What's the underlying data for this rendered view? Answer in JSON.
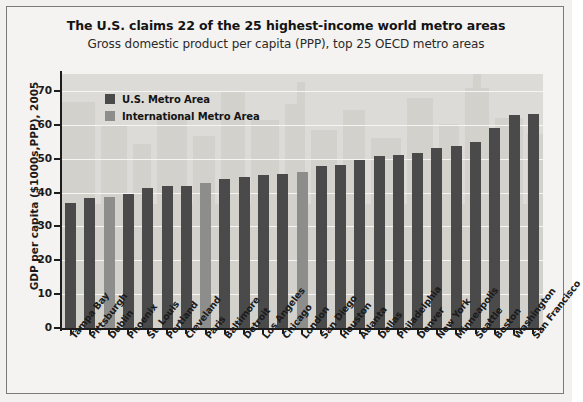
{
  "chart_data": {
    "type": "bar",
    "title": "The U.S. claims 22 of the 25 highest-income world metro areas",
    "subtitle": "Gross domestic product per capita (PPP), top 25 OECD metro areas",
    "xlabel": "",
    "ylabel": "GDP per capita ($1000s,PPP), 2005",
    "ylim": [
      0,
      75
    ],
    "yticks": [
      0,
      10,
      20,
      30,
      40,
      50,
      60,
      70
    ],
    "ytick_labels": [
      "0",
      "10",
      "20",
      "30",
      "40",
      "50",
      "60",
      "70"
    ],
    "grid": true,
    "legend_position": "upper-left-inside",
    "categories": [
      "Tampa Bay",
      "Pittsburgh",
      "Dublin",
      "Phoenix",
      "St. Louis",
      "Portland",
      "Cleveland",
      "Paris",
      "Baltimore",
      "Detroit",
      "Los Angeles",
      "Chicago",
      "London",
      "San Diego",
      "Houston",
      "Atlanta",
      "Dallas",
      "Philadelphia",
      "Denver",
      "New York",
      "Minneapolis",
      "Seattle",
      "Boston",
      "Washington",
      "San Francisco"
    ],
    "values": [
      37.0,
      38.5,
      38.8,
      39.5,
      41.2,
      41.8,
      42.0,
      42.8,
      44.0,
      44.5,
      45.2,
      45.5,
      46.2,
      47.8,
      48.0,
      49.5,
      50.8,
      51.2,
      51.8,
      53.2,
      53.8,
      54.8,
      59.0,
      63.0,
      63.2
    ],
    "series": [
      {
        "name": "U.S. Metro Area",
        "color": "#4a4a4a",
        "members": [
          "Tampa Bay",
          "Pittsburgh",
          "Phoenix",
          "St. Louis",
          "Portland",
          "Cleveland",
          "Baltimore",
          "Detroit",
          "Los Angeles",
          "Chicago",
          "San Diego",
          "Houston",
          "Atlanta",
          "Dallas",
          "Philadelphia",
          "Denver",
          "New York",
          "Minneapolis",
          "Seattle",
          "Boston",
          "Washington",
          "San Francisco"
        ]
      },
      {
        "name": "International Metro Area",
        "color": "#8d8d8b",
        "members": [
          "Dublin",
          "Paris",
          "London"
        ]
      }
    ],
    "bar_types": [
      "us",
      "us",
      "intl",
      "us",
      "us",
      "us",
      "us",
      "intl",
      "us",
      "us",
      "us",
      "us",
      "intl",
      "us",
      "us",
      "us",
      "us",
      "us",
      "us",
      "us",
      "us",
      "us",
      "us",
      "us",
      "us"
    ]
  },
  "legend": {
    "items": [
      {
        "label": "U.S. Metro Area",
        "color": "#4a4a4a"
      },
      {
        "label": "International Metro Area",
        "color": "#8d8d8b"
      }
    ]
  },
  "colors": {
    "us_bar": "#4a4a4a",
    "intl_bar": "#8d8d8b",
    "plot_background": "#dcdbd7",
    "figure_background": "#f4f3f1",
    "gridline": "#f6f5f3",
    "axis": "#1d1d1d",
    "skyline": "#d2d1cc"
  }
}
